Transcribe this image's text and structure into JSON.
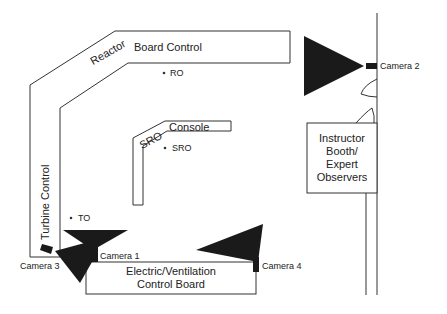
{
  "diagram": {
    "type": "control-room-floor-plan",
    "colors": {
      "line": "#333333",
      "camera_fill": "#1a1a1a",
      "background": "#ffffff"
    },
    "boards": {
      "reactor_board": {
        "label_angled": "Reactor",
        "label_straight": "Board Control"
      },
      "turbine_control": {
        "label": "Turbine Control"
      },
      "sro_console": {
        "label_angled": "SRO",
        "label_straight": "Console"
      },
      "electric_board": {
        "line1": "Electric/Ventilation",
        "line2": "Control Board"
      }
    },
    "operators": {
      "ro": {
        "label": "RO"
      },
      "sro": {
        "label": "SRO"
      },
      "to": {
        "label": "TO"
      }
    },
    "booth": {
      "line1": "Instructor",
      "line2": "Booth/",
      "line3": "Expert",
      "line4": "Observers"
    },
    "cameras": [
      {
        "id": "camera1",
        "label": "Camera 1"
      },
      {
        "id": "camera2",
        "label": "Camera 2"
      },
      {
        "id": "camera3",
        "label": "Camera 3"
      },
      {
        "id": "camera4",
        "label": "Camera 4"
      }
    ]
  }
}
